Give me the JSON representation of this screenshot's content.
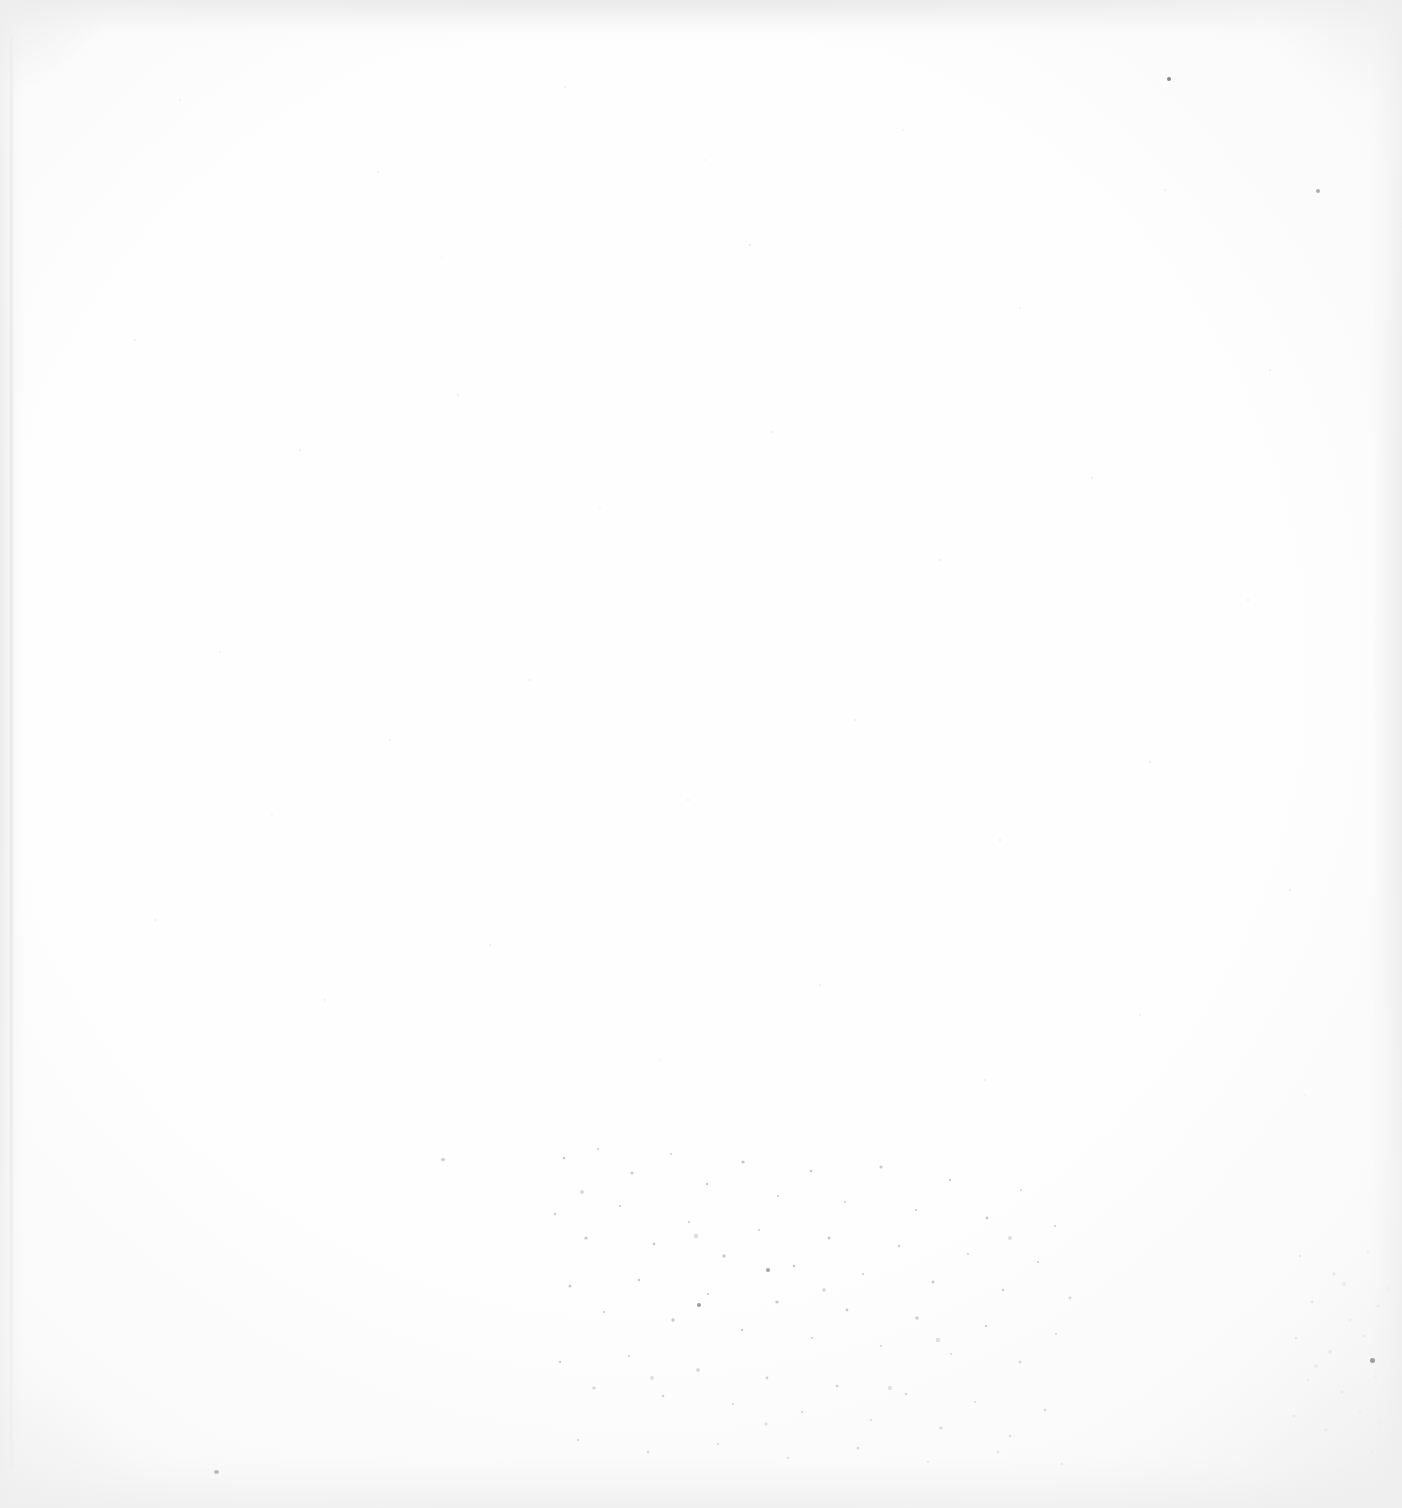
{
  "document": {
    "kind": "scanned-page-image",
    "page_label": "",
    "page_content": "",
    "visible_text": "",
    "notes_visible_on_page": "none",
    "orientation": "portrait",
    "width_px": 1402,
    "height_px": 1508
  },
  "page": {
    "background_color": "#fefefe",
    "paper_tone": "#ffffff",
    "content_present": false,
    "body_text_lines": [],
    "headers": [],
    "footers": [],
    "page_number_text": "",
    "captions": [],
    "labels": []
  },
  "scan_artifacts": {
    "description": "blank leaf",
    "edge_shading": {
      "top_band_color": "#e7e7e8",
      "bottom_band_color": "#e9e9ea",
      "left_band_color": "#eaeaeb",
      "right_band_color": "#e8e8e9"
    },
    "gutter_line_color": "#e0e0e2",
    "vignette_color": "#f0f0f0",
    "speckle_color": "#9a9a9e",
    "speckle_regions": [
      "lower-centre",
      "right-edge",
      "sparse-upper"
    ]
  },
  "colors": {
    "white": "#ffffff",
    "paper": "#fefefe",
    "edge_grey": "#e8e8e9",
    "speck_grey": "#9a9a9e",
    "dark_speck": "#6e6e74"
  }
}
